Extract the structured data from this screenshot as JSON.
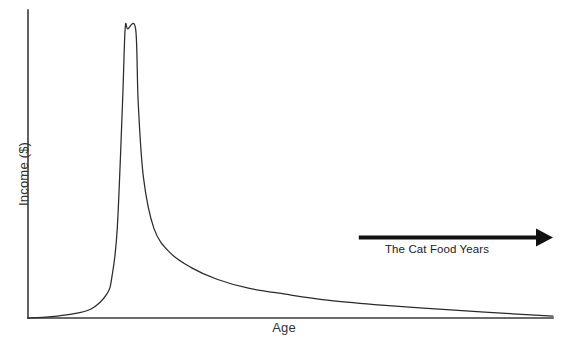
{
  "chart_data": {
    "type": "line",
    "title": "",
    "xlabel": "Age",
    "ylabel": "Income ($)",
    "grid": false,
    "legend": null,
    "axes": {
      "x_axis_visible": true,
      "y_axis_visible": true,
      "x_ticks": [],
      "y_ticks": [],
      "xlim": [
        0,
        100
      ],
      "ylim": [
        0,
        100
      ]
    },
    "series": [
      {
        "name": "Income over lifetime",
        "description": "Near-zero through youth, exponential rise to a brief narrow plateau at peak earning age, then long hyperbolic decay asymptotic to zero",
        "x": [
          0,
          4,
          8,
          12,
          15,
          16,
          17,
          18,
          18.5,
          19,
          20.5,
          21,
          22,
          24,
          27,
          31,
          36,
          42,
          49,
          57,
          66,
          76,
          87,
          100
        ],
        "y": [
          0,
          0.4,
          1.2,
          3.0,
          8.0,
          14.0,
          30.0,
          72.0,
          97.0,
          97.0,
          97.0,
          72.0,
          47.0,
          30.0,
          22.0,
          17.0,
          13.0,
          10.0,
          8.0,
          6.0,
          4.5,
          3.2,
          2.0,
          0.6
        ]
      }
    ],
    "annotations": [
      {
        "type": "arrow-with-label",
        "label": "The Cat Food Years",
        "direction": "right",
        "x_start": 63,
        "x_end": 100,
        "y": 27
      }
    ]
  },
  "labels": {
    "x_axis": "Age",
    "y_axis": "Income ($)",
    "annotation": "The Cat Food Years"
  },
  "colors": {
    "background": "#ffffff",
    "axis": "#3a3a3a",
    "curve": "#2b2b2b",
    "arrow": "#111111",
    "text": "#333333"
  }
}
